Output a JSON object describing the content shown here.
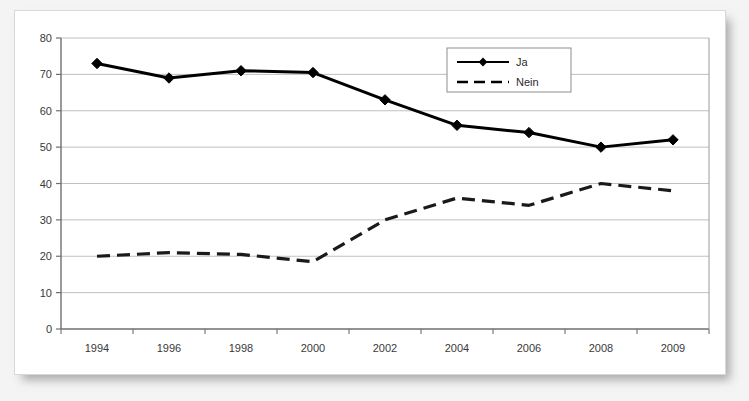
{
  "chart_data": {
    "type": "line",
    "title": "",
    "subtitle": "",
    "xlabel": "",
    "ylabel": "",
    "categories": [
      "1994",
      "1996",
      "1998",
      "2000",
      "2002",
      "2004",
      "2006",
      "2008",
      "2009"
    ],
    "series": [
      {
        "name": "Ja",
        "values": [
          73,
          69,
          71,
          70.5,
          63,
          56,
          54,
          50,
          52
        ],
        "style": "solid",
        "marker": "diamond",
        "color": "#000000"
      },
      {
        "name": "Nein",
        "values": [
          20,
          21,
          20.5,
          18.5,
          30,
          36,
          34,
          40,
          38
        ],
        "style": "dashed",
        "marker": "none",
        "color": "#1a1a1a"
      }
    ],
    "ylim": [
      0,
      80
    ],
    "ytick_step": 10,
    "yticks": [
      "0",
      "10",
      "20",
      "30",
      "40",
      "50",
      "60",
      "70",
      "80"
    ],
    "grid": "horizontal",
    "legend_position": "inside-top-right",
    "axis_color": "#6f6f6f",
    "grid_color": "#b9b9b9",
    "plot_background": "#ffffff"
  },
  "legend": {
    "items": [
      {
        "label": "Ja",
        "style": "solid",
        "marker": "diamond"
      },
      {
        "label": "Nein",
        "style": "dashed",
        "marker": "none"
      }
    ]
  },
  "card": {
    "background": "#ffffff",
    "border_color": "#d8d8d8"
  }
}
